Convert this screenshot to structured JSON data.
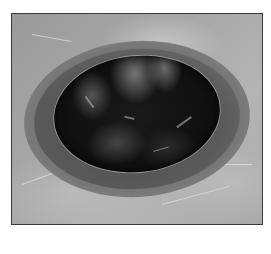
{
  "image": {
    "description": "Grayscale photograph of an elliptical pit/hole in a worn gray surface, surrounded by a darker ring",
    "palette": {
      "surface": "#a8a8a8",
      "ring": "#646464",
      "hole": "#111111",
      "frame_border": "#3a3a3a",
      "page_background": "#ffffff"
    }
  }
}
